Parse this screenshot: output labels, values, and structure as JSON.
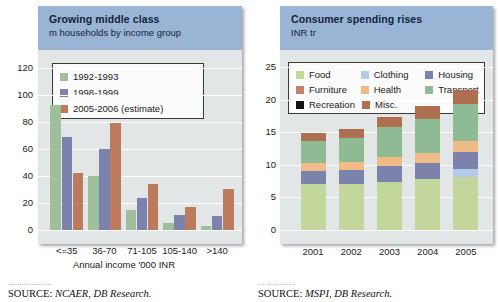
{
  "chart_data": [
    {
      "type": "bar",
      "title": "Growing middle class",
      "subtitle": "m households by income group",
      "xlabel": "Annual income '000 INR",
      "ylabel": "",
      "ylim": [
        0,
        130
      ],
      "yticks": [
        0,
        20,
        40,
        60,
        80,
        100,
        120
      ],
      "grid": true,
      "legend_position": "top-left",
      "categories": [
        "<=35",
        "36-70",
        "71-105",
        "105-140",
        ">140"
      ],
      "series": [
        {
          "name": "1992-1993",
          "color": "#9fbf9b",
          "values": [
            92,
            40,
            15,
            5,
            3
          ]
        },
        {
          "name": "1998-1999",
          "color": "#7b83ac",
          "values": [
            69,
            60,
            24,
            11,
            10
          ]
        },
        {
          "name": "2005-2006 (estimate)",
          "color": "#bd7b5e",
          "values": [
            42,
            79,
            34,
            17,
            30
          ]
        }
      ],
      "source_dots": "...................",
      "source_prefix": "SOURCE:",
      "source_text": "NCAER, DB Research."
    },
    {
      "type": "bar",
      "stacked": true,
      "title": "Consumer spending rises",
      "subtitle": "INR tr",
      "xlabel": "",
      "ylabel": "",
      "ylim": [
        0,
        27
      ],
      "yticks": [
        0,
        5,
        10,
        15,
        20,
        25
      ],
      "grid": true,
      "legend_position": "top",
      "categories": [
        "2001",
        "2002",
        "2003",
        "2004",
        "2005"
      ],
      "series": [
        {
          "name": "Food",
          "color": "#c3d69b",
          "values": [
            7.0,
            7.0,
            7.4,
            7.8,
            8.2
          ]
        },
        {
          "name": "Clothing",
          "color": "#b3cbe8",
          "values": [
            0.0,
            0.0,
            0.0,
            0.0,
            1.1
          ]
        },
        {
          "name": "Housing",
          "color": "#7b83ac",
          "values": [
            2.1,
            2.2,
            2.4,
            2.5,
            2.7
          ]
        },
        {
          "name": "Furniture",
          "color": "#c08268",
          "values": [
            0.0,
            0.0,
            0.0,
            0.0,
            0.0
          ]
        },
        {
          "name": "Health",
          "color": "#f0bb86",
          "values": [
            1.2,
            1.3,
            1.4,
            1.5,
            1.6
          ]
        },
        {
          "name": "Transport",
          "color": "#8fbb94",
          "values": [
            3.3,
            3.6,
            4.6,
            5.3,
            5.7
          ]
        },
        {
          "name": "Recreation",
          "color": "#111111",
          "values": [
            0.0,
            0.0,
            0.0,
            0.0,
            0.0
          ]
        },
        {
          "name": "Misc.",
          "color": "#ad6f50",
          "values": [
            1.3,
            1.4,
            1.6,
            1.9,
            2.2
          ]
        }
      ],
      "totals": [
        14.9,
        15.5,
        17.4,
        19.0,
        21.5
      ],
      "source_dots": "................",
      "source_prefix": "SOURCE:",
      "source_text": "MSPI, DB Research."
    }
  ]
}
